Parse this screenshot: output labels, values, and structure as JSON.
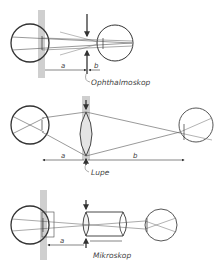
{
  "figure": {
    "panels": [
      {
        "id": "ophthalmoskop",
        "caption": "Ophthalmoskop",
        "distance_labels": [
          "a",
          "b"
        ]
      },
      {
        "id": "lupe",
        "caption": "Lupe",
        "distance_labels": [
          "a",
          "b"
        ]
      },
      {
        "id": "mikroskop",
        "caption": "Mikroskop",
        "distance_labels": [
          "a"
        ]
      }
    ],
    "colors": {
      "line": "#333333",
      "gray_band": "#cfcfcf",
      "background": "#ffffff"
    }
  }
}
